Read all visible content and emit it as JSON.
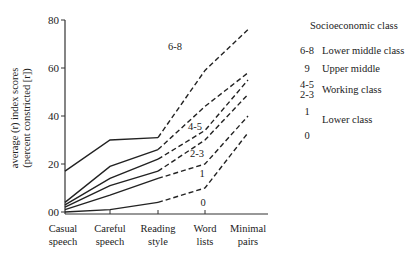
{
  "chart_data": {
    "type": "line",
    "title": "",
    "xlabel": "",
    "ylabel": "average (r) index scores (percent constricted [r])",
    "ylabel_lines": [
      "average (r) index scores",
      "(percent constricted [r])"
    ],
    "ylim": [
      0,
      80
    ],
    "yticks": [
      "00",
      "20",
      "40",
      "60",
      "80"
    ],
    "categories": [
      "Casual speech",
      "Careful speech",
      "Reading style",
      "Word lists",
      "Minimal pairs"
    ],
    "category_lines": [
      [
        "Casual",
        "speech"
      ],
      [
        "Careful",
        "speech"
      ],
      [
        "Reading",
        "style"
      ],
      [
        "Word",
        "lists"
      ],
      [
        "Minimal",
        "pairs"
      ]
    ],
    "grid": false,
    "note": "Solid lines for casual–reading styles; dashed lines for reading–minimal pairs",
    "series": [
      {
        "name": "6-8",
        "values": [
          17,
          30,
          31,
          59,
          76
        ]
      },
      {
        "name": "9",
        "values": [
          4,
          19,
          26,
          44,
          58
        ]
      },
      {
        "name": "4-5",
        "values": [
          3,
          14,
          22,
          34,
          55
        ]
      },
      {
        "name": "2-3",
        "values": [
          2,
          11,
          17,
          30,
          49
        ]
      },
      {
        "name": "1",
        "values": [
          1,
          7,
          14,
          20,
          40
        ]
      },
      {
        "name": "0",
        "values": [
          0,
          1,
          4,
          10,
          33
        ]
      }
    ],
    "inline_labels": [
      {
        "text": "6-8",
        "x": 175,
        "y": 50
      },
      {
        "text": "4-5",
        "x": 195,
        "y": 130
      },
      {
        "text": "2-3",
        "x": 197,
        "y": 157
      },
      {
        "text": "1",
        "x": 202,
        "y": 177
      },
      {
        "text": "0",
        "x": 203,
        "y": 206
      }
    ],
    "legend": {
      "title": "Socioeconomic class",
      "position": "right",
      "entries": [
        {
          "key": "6-8",
          "label": "Lower middle class"
        },
        {
          "key": "9",
          "label": "Upper middle"
        },
        {
          "key": "4-5\n2-3",
          "key_lines": [
            "4-5",
            "2-3"
          ],
          "label": "Working class"
        },
        {
          "key": "1",
          "label": "Lower class"
        },
        {
          "key": "0",
          "label": ""
        }
      ]
    }
  }
}
